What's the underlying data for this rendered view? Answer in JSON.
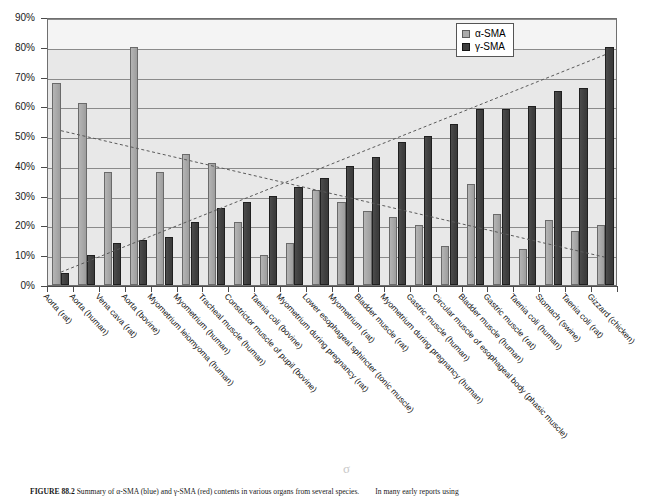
{
  "figure": {
    "caption_label": "FIGURE 88.2",
    "caption_text": "Summary of α-SMA (blue) and γ-SMA (red) contents in various organs from several species.",
    "caption_tail": "In many early reports using",
    "artifact_glyph": "σ"
  },
  "legend": {
    "position": "top-right",
    "entries": [
      {
        "label": "α-SMA",
        "color": "#ababab"
      },
      {
        "label": "γ-SMA",
        "color": "#3f3f3f"
      }
    ]
  },
  "axis": {
    "y_ticks": [
      "0%",
      "10%",
      "20%",
      "30%",
      "40%",
      "50%",
      "60%",
      "70%",
      "80%",
      "90%"
    ],
    "y_min": 0,
    "y_max": 90
  },
  "chart_data": {
    "type": "bar",
    "title": "",
    "xlabel": "",
    "ylabel": "",
    "ylim": [
      0,
      90
    ],
    "ytick_step": 10,
    "grid": true,
    "legend_position": "top-right",
    "categories": [
      "Aorta (rat)",
      "Aorta (human)",
      "Vena cava (rat)",
      "Aorta (bovine)",
      "Myometrium leiomyoma (human)",
      "Myometrium (human)",
      "Tracheal muscle (human)",
      "Constrictor muscle of pupil (bovine)",
      "Taenia coli (bovine)",
      "Myometrium during pregnancy (rat)",
      "Lower esophageal sphincter (tonic muscle)",
      "Myometrium (rat)",
      "Bladder muscle (rat)",
      "Myometrium during pregnancy (human)",
      "Gastric muscle (human)",
      "Circular muscle of esophageal body (phasic muscle)",
      "Bladder muscle (human)",
      "Gastric muscle (rat)",
      "Taenia coli (human)",
      "Stomach (swine)",
      "Taenia coli (rat)",
      "Gizzard (chicken)"
    ],
    "series": [
      {
        "name": "α-SMA",
        "color": "#ababab",
        "values": [
          68,
          61,
          38,
          80,
          38,
          44,
          41,
          21,
          10,
          14,
          32,
          28,
          25,
          23,
          20,
          13,
          34,
          24,
          12,
          22,
          18,
          20
        ]
      },
      {
        "name": "γ-SMA",
        "color": "#3f3f3f",
        "values": [
          4,
          10,
          14,
          15,
          16,
          21,
          26,
          28,
          30,
          33,
          36,
          40,
          43,
          48,
          50,
          54,
          59,
          59,
          60,
          65,
          66,
          80
        ]
      }
    ],
    "trendlines": [
      {
        "name": "α-SMA-trend",
        "style": "dashed",
        "start_value": 52.5,
        "end_value": 10.0
      },
      {
        "name": "γ-SMA-trend",
        "style": "dashed",
        "start_value": 5.0,
        "end_value": 78.0
      }
    ]
  }
}
